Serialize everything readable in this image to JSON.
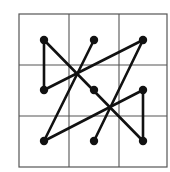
{
  "diagram": {
    "grid": {
      "rows": 3,
      "cols": 3,
      "x0": 19,
      "y0": 14,
      "x1": 167,
      "y1": 167,
      "v_lines": [
        69,
        119
      ],
      "h_lines": [
        65,
        116
      ],
      "line_color": "#555555"
    },
    "dots": [
      {
        "id": "r1c1",
        "x": 44,
        "y": 40
      },
      {
        "id": "r1c2",
        "x": 94,
        "y": 40
      },
      {
        "id": "r1c3",
        "x": 143,
        "y": 40
      },
      {
        "id": "r2c1",
        "x": 44,
        "y": 90
      },
      {
        "id": "r2c2",
        "x": 94,
        "y": 90
      },
      {
        "id": "r2c3",
        "x": 143,
        "y": 90
      },
      {
        "id": "r3c1",
        "x": 44,
        "y": 141
      },
      {
        "id": "r3c2",
        "x": 94,
        "y": 141
      },
      {
        "id": "r3c3",
        "x": 143,
        "y": 141
      }
    ],
    "segments": [
      {
        "from": "r1c1",
        "to": "r2c1"
      },
      {
        "from": "r2c1",
        "to": "r1c3"
      },
      {
        "from": "r1c3",
        "to": "r3c2"
      },
      {
        "from": "r1c1",
        "to": "r3c3"
      },
      {
        "from": "r3c3",
        "to": "r2c3"
      },
      {
        "from": "r2c3",
        "to": "r3c1"
      },
      {
        "from": "r3c1",
        "to": "r1c2"
      }
    ],
    "stroke_color": "#111111"
  }
}
